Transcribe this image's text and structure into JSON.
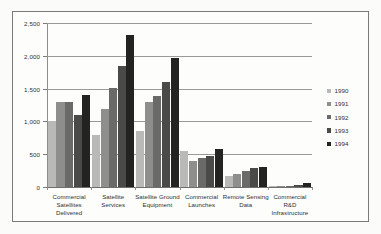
{
  "chart_data": {
    "type": "bar",
    "title": "",
    "subtitle": "",
    "xlabel": "",
    "ylabel": "",
    "ylim": [
      0,
      2500
    ],
    "y_ticks": [
      0,
      500,
      1000,
      1500,
      2000,
      2500
    ],
    "y_tick_labels": [
      "0",
      "500",
      "1,000",
      "1,500",
      "2,000",
      "2,500"
    ],
    "grid": true,
    "legend_position": "right",
    "categories": [
      "Commercial Satellites Delivered",
      "Satellite Services",
      "Satellite Ground Equipment",
      "Commercial Launches",
      "Remote Sensing Data",
      "Commercial R&D Infrastructure"
    ],
    "category_label_lines": [
      [
        "Commercial",
        "Satellites",
        "Delivered"
      ],
      [
        "Satellite",
        "Services"
      ],
      [
        "Satellite Ground",
        "Equipment"
      ],
      [
        "Commercial",
        "Launches"
      ],
      [
        "Remote Sensing",
        "Data"
      ],
      [
        "Commercial",
        "R&D",
        "Infrastructure"
      ]
    ],
    "series": [
      {
        "name": "1990",
        "color": "#b9b9b7",
        "values": [
          1000,
          790,
          860,
          550,
          165,
          5
        ]
      },
      {
        "name": "1991",
        "color": "#8e8e8c",
        "values": [
          1300,
          1195,
          1290,
          390,
          205,
          8
        ]
      },
      {
        "name": "1992",
        "color": "#6a6a68",
        "values": [
          1300,
          1505,
          1395,
          440,
          245,
          12
        ]
      },
      {
        "name": "1993",
        "color": "#4a4a48",
        "values": [
          1100,
          1850,
          1600,
          470,
          290,
          35
        ]
      },
      {
        "name": "1994",
        "color": "#232321",
        "values": [
          1400,
          2320,
          1960,
          580,
          305,
          60
        ]
      }
    ]
  }
}
